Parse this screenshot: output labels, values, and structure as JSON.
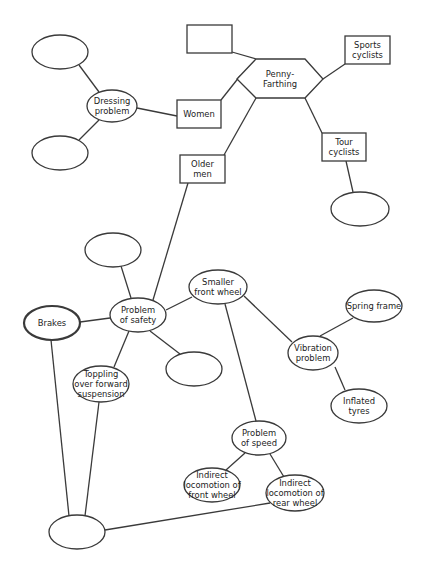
{
  "diagram": {
    "width": 424,
    "height": 576,
    "colors": {
      "stroke": "#3a3a3a",
      "text": "#222222",
      "fill": "#ffffff",
      "background": "#ffffff"
    },
    "nodes": [
      {
        "id": "empty_top_left",
        "shape": "ellipse",
        "cx": 60,
        "cy": 52,
        "rx": 28,
        "ry": 17,
        "lines": []
      },
      {
        "id": "dressing_problem",
        "shape": "ellipse",
        "cx": 112,
        "cy": 106,
        "rx": 25,
        "ry": 16,
        "lines": [
          "Dressing",
          "problem"
        ]
      },
      {
        "id": "empty_mid_left",
        "shape": "ellipse",
        "cx": 60,
        "cy": 153,
        "rx": 28,
        "ry": 17,
        "lines": []
      },
      {
        "id": "women",
        "shape": "rect",
        "x": 177,
        "y": 100,
        "w": 44,
        "h": 28,
        "lines": [
          "Women"
        ]
      },
      {
        "id": "empty_top_rect",
        "shape": "rect",
        "x": 187,
        "y": 25,
        "w": 45,
        "h": 28,
        "lines": []
      },
      {
        "id": "penny_farthing",
        "shape": "hexagon",
        "points": [
          [
            237,
            79
          ],
          [
            256,
            59
          ],
          [
            305,
            59
          ],
          [
            323,
            79
          ],
          [
            305,
            98
          ],
          [
            256,
            98
          ]
        ],
        "cx": 280,
        "cy": 79,
        "lines": [
          "Penny-",
          "Farthing"
        ]
      },
      {
        "id": "sports_cyclists",
        "shape": "rect",
        "x": 345,
        "y": 36,
        "w": 45,
        "h": 28,
        "lines": [
          "Sports",
          "cyclists"
        ]
      },
      {
        "id": "tour_cyclists",
        "shape": "rect",
        "x": 322,
        "y": 133,
        "w": 44,
        "h": 28,
        "lines": [
          "Tour",
          "cyclists"
        ]
      },
      {
        "id": "empty_tour",
        "shape": "ellipse",
        "cx": 360,
        "cy": 209,
        "rx": 29,
        "ry": 17,
        "lines": []
      },
      {
        "id": "older_men",
        "shape": "rect",
        "x": 180,
        "y": 155,
        "w": 45,
        "h": 28,
        "lines": [
          "Older",
          "men"
        ]
      },
      {
        "id": "empty_above_safety",
        "shape": "ellipse",
        "cx": 113,
        "cy": 250,
        "rx": 28,
        "ry": 17,
        "lines": []
      },
      {
        "id": "problem_of_safety",
        "shape": "ellipse",
        "cx": 138,
        "cy": 315,
        "rx": 28,
        "ry": 17,
        "lines": [
          "Problem",
          "of safety"
        ]
      },
      {
        "id": "brakes",
        "shape": "ellipse",
        "cx": 52,
        "cy": 323,
        "rx": 28,
        "ry": 17,
        "thick": true,
        "lines": [
          "Brakes"
        ]
      },
      {
        "id": "smaller_front_wheel",
        "shape": "ellipse",
        "cx": 218,
        "cy": 287,
        "rx": 29,
        "ry": 17,
        "lines": [
          "Smaller",
          "front wheel"
        ]
      },
      {
        "id": "empty_below_safety",
        "shape": "ellipse",
        "cx": 194,
        "cy": 369,
        "rx": 28,
        "ry": 17,
        "lines": []
      },
      {
        "id": "toppling",
        "shape": "ellipse",
        "cx": 101,
        "cy": 384,
        "rx": 28,
        "ry": 18,
        "lines": [
          "Toppling",
          "over forward",
          "suspension"
        ]
      },
      {
        "id": "vibration_problem",
        "shape": "ellipse",
        "cx": 313,
        "cy": 353,
        "rx": 25,
        "ry": 17,
        "lines": [
          "Vibration",
          "problem"
        ]
      },
      {
        "id": "spring_frame",
        "shape": "ellipse",
        "cx": 374,
        "cy": 306,
        "rx": 28,
        "ry": 16,
        "lines": [
          "Spring frame"
        ]
      },
      {
        "id": "inflated_tyres",
        "shape": "ellipse",
        "cx": 359,
        "cy": 406,
        "rx": 28,
        "ry": 17,
        "lines": [
          "Inflated",
          "tyres"
        ]
      },
      {
        "id": "problem_of_speed",
        "shape": "ellipse",
        "cx": 259,
        "cy": 438,
        "rx": 27,
        "ry": 17,
        "lines": [
          "Problem",
          "of speed"
        ]
      },
      {
        "id": "indirect_front",
        "shape": "ellipse",
        "cx": 212,
        "cy": 485,
        "rx": 28,
        "ry": 17,
        "lines": [
          "Indirect",
          "locomotion of",
          "front wheel"
        ]
      },
      {
        "id": "indirect_rear",
        "shape": "ellipse",
        "cx": 295,
        "cy": 493,
        "rx": 29,
        "ry": 18,
        "lines": [
          "Indirect",
          "locomotion of",
          "rear wheel"
        ]
      },
      {
        "id": "empty_bottom",
        "shape": "ellipse",
        "cx": 77,
        "cy": 532,
        "rx": 28,
        "ry": 17,
        "lines": []
      }
    ],
    "edges": [
      {
        "from": "empty_top_left",
        "to": "dressing_problem",
        "x1": 79,
        "y1": 65,
        "x2": 99,
        "y2": 92
      },
      {
        "from": "empty_mid_left",
        "to": "dressing_problem",
        "x1": 79,
        "y1": 140,
        "x2": 99,
        "y2": 120
      },
      {
        "from": "dressing_problem",
        "to": "women",
        "x1": 137,
        "y1": 108,
        "x2": 177,
        "y2": 116
      },
      {
        "from": "empty_top_rect",
        "to": "penny_farthing",
        "x1": 232,
        "y1": 52,
        "x2": 256,
        "y2": 59
      },
      {
        "from": "women",
        "to": "penny_farthing",
        "x1": 221,
        "y1": 100,
        "x2": 240,
        "y2": 76
      },
      {
        "from": "penny_farthing",
        "to": "sports_cyclists",
        "x1": 323,
        "y1": 79,
        "x2": 345,
        "y2": 64
      },
      {
        "from": "penny_farthing",
        "to": "older_men",
        "x1": 256,
        "y1": 98,
        "x2": 224,
        "y2": 155
      },
      {
        "from": "penny_farthing",
        "to": "tour_cyclists",
        "x1": 305,
        "y1": 98,
        "x2": 322,
        "y2": 133
      },
      {
        "from": "tour_cyclists",
        "to": "empty_tour",
        "x1": 346,
        "y1": 161,
        "x2": 353,
        "y2": 192
      },
      {
        "from": "older_men",
        "to": "problem_of_safety",
        "x1": 188,
        "y1": 183,
        "x2": 153,
        "y2": 300
      },
      {
        "from": "empty_above_safety",
        "to": "problem_of_safety",
        "x1": 121,
        "y1": 266,
        "x2": 131,
        "y2": 298
      },
      {
        "from": "brakes",
        "to": "problem_of_safety",
        "x1": 80,
        "y1": 322,
        "x2": 110,
        "y2": 318
      },
      {
        "from": "problem_of_safety",
        "to": "smaller_front_wheel",
        "x1": 166,
        "y1": 310,
        "x2": 192,
        "y2": 297
      },
      {
        "from": "problem_of_safety",
        "to": "empty_below_safety",
        "x1": 150,
        "y1": 331,
        "x2": 180,
        "y2": 354
      },
      {
        "from": "problem_of_safety",
        "to": "toppling",
        "x1": 129,
        "y1": 331,
        "x2": 114,
        "y2": 367
      },
      {
        "from": "smaller_front_wheel",
        "to": "vibration_problem",
        "x1": 244,
        "y1": 296,
        "x2": 292,
        "y2": 342
      },
      {
        "from": "smaller_front_wheel",
        "to": "problem_of_speed",
        "x1": 225,
        "y1": 304,
        "x2": 256,
        "y2": 421
      },
      {
        "from": "vibration_problem",
        "to": "spring_frame",
        "x1": 320,
        "y1": 336,
        "x2": 353,
        "y2": 318
      },
      {
        "from": "vibration_problem",
        "to": "inflated_tyres",
        "x1": 335,
        "y1": 367,
        "x2": 345,
        "y2": 390
      },
      {
        "from": "problem_of_speed",
        "to": "indirect_front",
        "x1": 245,
        "y1": 453,
        "x2": 226,
        "y2": 470
      },
      {
        "from": "problem_of_speed",
        "to": "indirect_rear",
        "x1": 270,
        "y1": 454,
        "x2": 284,
        "y2": 477
      },
      {
        "from": "brakes",
        "to": "empty_bottom",
        "x1": 51,
        "y1": 340,
        "x2": 69,
        "y2": 516
      },
      {
        "from": "toppling",
        "to": "empty_bottom",
        "x1": 99,
        "y1": 402,
        "x2": 85,
        "y2": 516
      },
      {
        "from": "empty_bottom",
        "to": "indirect_rear",
        "x1": 105,
        "y1": 530,
        "x2": 270,
        "y2": 503
      }
    ]
  }
}
